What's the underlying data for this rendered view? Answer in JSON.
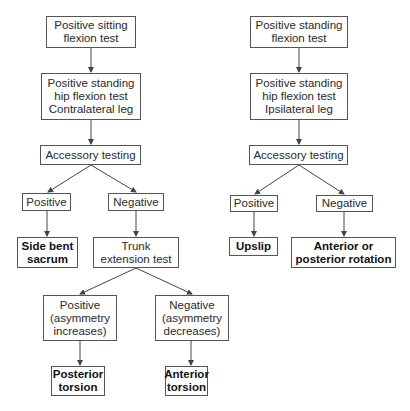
{
  "diagram": {
    "type": "flowchart",
    "left_branch": {
      "start": "Positive sitting\nflexion test",
      "step2": "Positive standing\nhip flexion test\nContralateral leg",
      "step3": "Accessory testing",
      "positive": "Positive",
      "negative": "Negative",
      "positive_result": "Side bent\nsacrum",
      "trunk_test": "Trunk\nextension test",
      "trunk_positive": "Positive\n(asymmetry\nincreases)",
      "trunk_negative": "Negative\n(asymmetry\ndecreases)",
      "trunk_positive_result": "Posterior\ntorsion",
      "trunk_negative_result": "Anterior\ntorsion"
    },
    "right_branch": {
      "start": "Positive standing\nflexion test",
      "step2": "Positive standing\nhip flexion test\nIpsilateral leg",
      "step3": "Accessory testing",
      "positive": "Positive",
      "negative": "Negative",
      "positive_result": "Upslip",
      "negative_result": "Anterior or\nposterior rotation"
    },
    "colors": {
      "border": "#555555",
      "arrow": "#444444",
      "text": "#2a2a2a"
    }
  }
}
